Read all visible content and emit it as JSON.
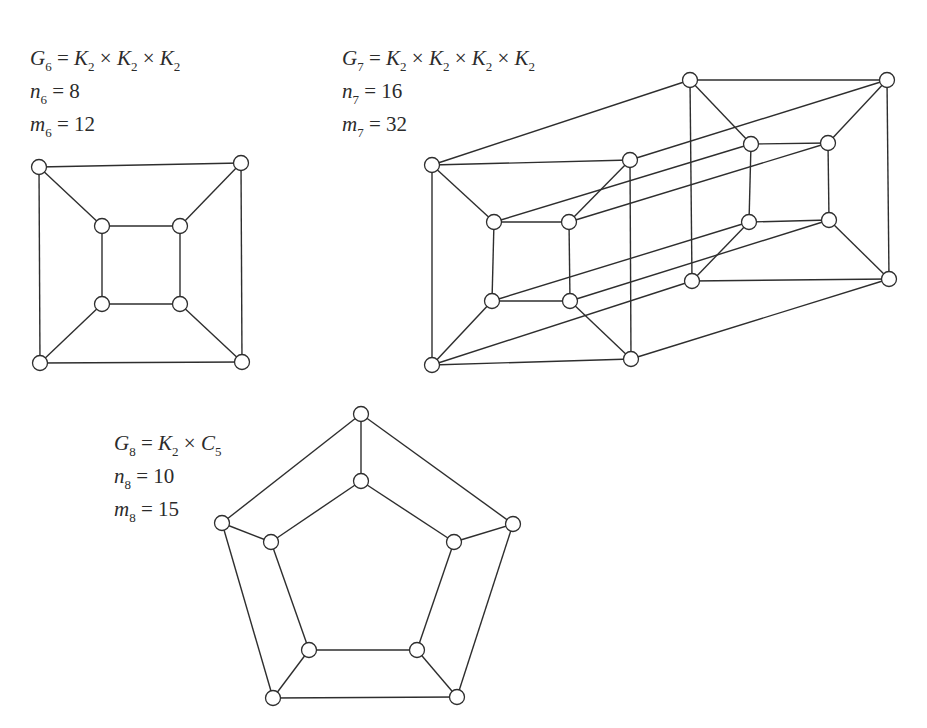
{
  "figure": {
    "top_cut_text": "· · · ·",
    "graphs": [
      {
        "id": "G6",
        "name_sym": "G",
        "name_sub": "6",
        "definition": [
          {
            "sym": "K",
            "sub": "2"
          },
          {
            "sym": "K",
            "sub": "2"
          },
          {
            "sym": "K",
            "sub": "2"
          }
        ],
        "n_sym": "n",
        "n_sub": "6",
        "n_value": "8",
        "m_sym": "m",
        "m_sub": "6",
        "m_value": "12",
        "node_radius": 7.5,
        "nodes": [
          [
            39,
            167
          ],
          [
            241,
            163
          ],
          [
            40,
            363
          ],
          [
            242,
            362
          ],
          [
            102,
            226
          ],
          [
            180,
            226
          ],
          [
            102,
            304
          ],
          [
            180,
            304
          ]
        ],
        "edges": [
          [
            0,
            1
          ],
          [
            1,
            3
          ],
          [
            3,
            2
          ],
          [
            2,
            0
          ],
          [
            4,
            5
          ],
          [
            5,
            7
          ],
          [
            7,
            6
          ],
          [
            6,
            4
          ],
          [
            0,
            4
          ],
          [
            1,
            5
          ],
          [
            2,
            6
          ],
          [
            3,
            7
          ]
        ]
      },
      {
        "id": "G7",
        "name_sym": "G",
        "name_sub": "7",
        "definition": [
          {
            "sym": "K",
            "sub": "2"
          },
          {
            "sym": "K",
            "sub": "2"
          },
          {
            "sym": "K",
            "sub": "2"
          },
          {
            "sym": "K",
            "sub": "2"
          }
        ],
        "n_sym": "n",
        "n_sub": "7",
        "n_value": "16",
        "m_sym": "m",
        "m_sub": "7",
        "m_value": "32",
        "node_radius": 7.5,
        "nodes": [
          [
            432,
            165
          ],
          [
            630,
            160
          ],
          [
            432,
            365
          ],
          [
            631,
            359
          ],
          [
            494,
            222
          ],
          [
            569,
            222
          ],
          [
            492,
            301
          ],
          [
            570,
            301
          ],
          [
            690,
            80
          ],
          [
            887,
            80
          ],
          [
            692,
            281
          ],
          [
            889,
            279
          ],
          [
            751,
            144
          ],
          [
            828,
            143
          ],
          [
            749,
            222
          ],
          [
            829,
            220
          ]
        ],
        "edges": [
          [
            0,
            1
          ],
          [
            1,
            3
          ],
          [
            3,
            2
          ],
          [
            2,
            0
          ],
          [
            4,
            5
          ],
          [
            5,
            7
          ],
          [
            7,
            6
          ],
          [
            6,
            4
          ],
          [
            0,
            4
          ],
          [
            1,
            5
          ],
          [
            2,
            6
          ],
          [
            3,
            7
          ],
          [
            8,
            9
          ],
          [
            9,
            11
          ],
          [
            11,
            10
          ],
          [
            10,
            8
          ],
          [
            12,
            13
          ],
          [
            13,
            15
          ],
          [
            15,
            14
          ],
          [
            14,
            12
          ],
          [
            8,
            12
          ],
          [
            9,
            13
          ],
          [
            10,
            14
          ],
          [
            11,
            15
          ],
          [
            0,
            8
          ],
          [
            1,
            9
          ],
          [
            2,
            10
          ],
          [
            3,
            11
          ],
          [
            4,
            12
          ],
          [
            5,
            13
          ],
          [
            6,
            14
          ],
          [
            7,
            15
          ]
        ]
      },
      {
        "id": "G8",
        "name_sym": "G",
        "name_sub": "8",
        "definition": [
          {
            "sym": "K",
            "sub": "2"
          },
          {
            "sym": "C",
            "sub": "5"
          }
        ],
        "n_sym": "n",
        "n_sub": "8",
        "n_value": "10",
        "m_sym": "m",
        "m_sub": "8",
        "m_value": "15",
        "node_radius": 7.5,
        "nodes": [
          [
            361,
            414
          ],
          [
            513,
            524
          ],
          [
            457,
            697
          ],
          [
            273,
            698
          ],
          [
            222,
            523
          ],
          [
            361,
            481
          ],
          [
            454,
            542
          ],
          [
            417,
            650
          ],
          [
            309,
            650
          ],
          [
            271,
            542
          ]
        ],
        "edges": [
          [
            0,
            1
          ],
          [
            1,
            2
          ],
          [
            2,
            3
          ],
          [
            3,
            4
          ],
          [
            4,
            0
          ],
          [
            5,
            6
          ],
          [
            6,
            7
          ],
          [
            7,
            8
          ],
          [
            8,
            9
          ],
          [
            9,
            5
          ],
          [
            0,
            5
          ],
          [
            1,
            6
          ],
          [
            2,
            7
          ],
          [
            3,
            8
          ],
          [
            4,
            9
          ]
        ]
      }
    ]
  }
}
